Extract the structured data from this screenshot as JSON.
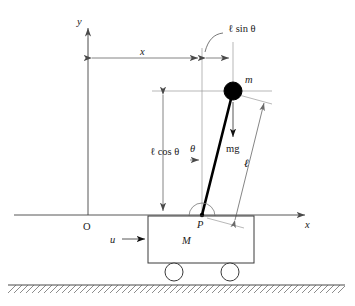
{
  "figure": {
    "background_color": "#ffffff",
    "line_color": "#555555",
    "rod_color": "#000000",
    "bob_color": "#000000"
  },
  "axes": {
    "y_label": "y",
    "x_label": "x",
    "origin_label": "O"
  },
  "labels": {
    "horizontal_displacement": "x",
    "l_sin_theta": "ℓ sin θ",
    "l_cos_theta": "ℓ cos θ",
    "rod_length": "ℓ",
    "angle": "θ",
    "bob_mass": "m",
    "gravity_force": "mg",
    "cart_mass": "M",
    "input_force": "u",
    "pivot": "P"
  },
  "geometry": {
    "origin": {
      "x": 88,
      "y": 215
    },
    "pivot": {
      "x": 202,
      "y": 215
    },
    "bob_center": {
      "x": 233,
      "y": 91
    },
    "bob_radius": 9,
    "cart": {
      "left": 148,
      "top": 216,
      "width": 106,
      "height": 47
    },
    "wheels": [
      {
        "cx": 174,
        "cy": 272,
        "r": 9
      },
      {
        "cx": 230,
        "cy": 272,
        "r": 9
      }
    ],
    "ground_y": 285,
    "x_axis": {
      "x1": 14,
      "x2": 312,
      "y": 215
    },
    "y_axis": {
      "x": 88,
      "y1": 22,
      "y2": 215
    }
  }
}
